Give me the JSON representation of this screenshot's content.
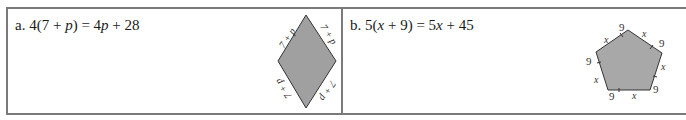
{
  "problems": [
    {
      "label": "a.",
      "equation_parts": [
        "4(7 + ",
        "p",
        ") = 4",
        "p",
        " + 28"
      ],
      "equation": "4(7 + p) = 4p + 28",
      "figure": {
        "shape": "rhombus",
        "fill": "#a0a0a0",
        "side_labels": [
          "7 + p",
          "7 + p",
          "7 + p",
          "7 + p"
        ]
      }
    },
    {
      "label": "b.",
      "equation_parts": [
        "5(",
        "x",
        " + 9) = 5",
        "x",
        " + 45"
      ],
      "equation": "5(x + 9) = 5x + 45",
      "figure": {
        "shape": "pentagon",
        "fill": "#a8a8a8",
        "segment_labels": [
          "x",
          "9",
          "x",
          "9",
          "x",
          "9",
          "x",
          "9",
          "x",
          "9"
        ]
      }
    }
  ],
  "colors": {
    "border": "#7a7a7a",
    "figure_stroke": "#333333"
  }
}
